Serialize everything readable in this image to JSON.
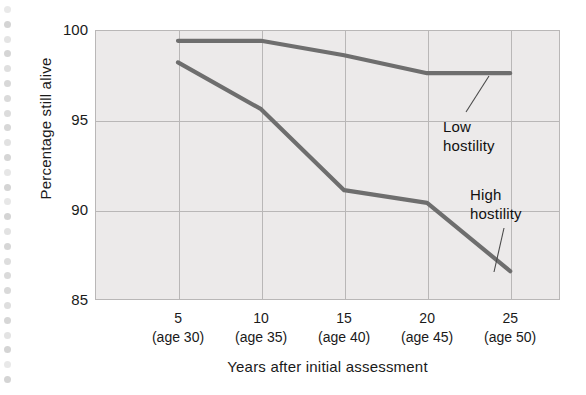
{
  "chart_data": {
    "type": "line",
    "title": "",
    "xlabel": "Years after initial assessment",
    "ylabel": "Percentage still alive",
    "x": [
      5,
      10,
      15,
      20,
      25
    ],
    "categories": [
      "5\n(age 30)",
      "10\n(age 35)",
      "15\n(age 40)",
      "20\n(age 45)",
      "25\n(age 50)"
    ],
    "xtick_labels": [
      {
        "main": "5",
        "sub": "(age 30)"
      },
      {
        "main": "10",
        "sub": "(age 35)"
      },
      {
        "main": "15",
        "sub": "(age 40)"
      },
      {
        "main": "20",
        "sub": "(age 45)"
      },
      {
        "main": "25",
        "sub": "(age 50)"
      }
    ],
    "ytick_labels": [
      "100",
      "95",
      "90",
      "85"
    ],
    "ytick_values": [
      100,
      95,
      90,
      85
    ],
    "ylim": [
      85,
      100
    ],
    "xlim": [
      0,
      28
    ],
    "grid": true,
    "legend_position": "inline-annotation",
    "series": [
      {
        "name": "Low hostility",
        "values": [
          99.4,
          99.4,
          98.6,
          97.6,
          97.6
        ],
        "color": "#6e6e6e"
      },
      {
        "name": "High hostility",
        "values": [
          98.2,
          95.6,
          91.1,
          90.4,
          86.6
        ],
        "color": "#6e6e6e"
      }
    ],
    "annotations": [
      {
        "id": "low",
        "line1": "Low",
        "line2": "hostility"
      },
      {
        "id": "high",
        "line1": "High",
        "line2": "hostility"
      }
    ]
  },
  "colors": {
    "plot_background": "#eceaea",
    "grid": "#b9b7b7",
    "series": "#6e6e6e",
    "text": "#1a1a1a",
    "page_background": "#ffffff"
  }
}
